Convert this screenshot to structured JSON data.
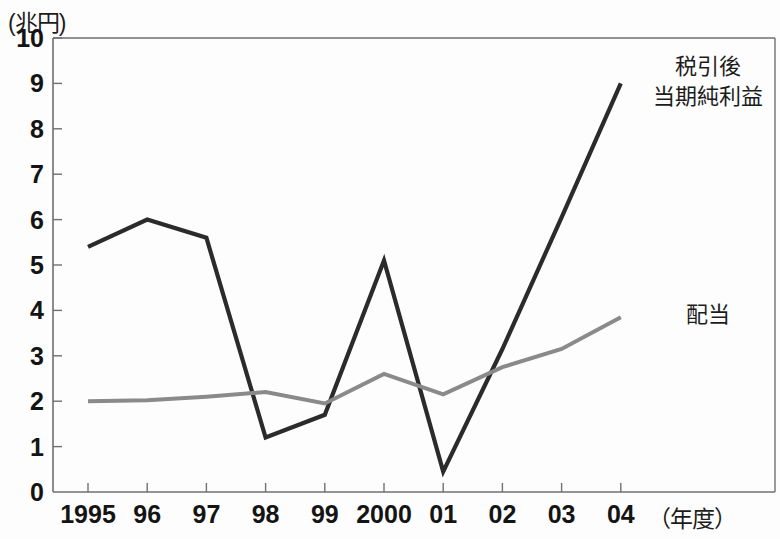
{
  "axis": {
    "y_unit_label": "(兆円)",
    "x_unit_label": "（年度）",
    "y_ticks": [
      "0",
      "1",
      "2",
      "3",
      "4",
      "5",
      "6",
      "7",
      "8",
      "9",
      "10"
    ],
    "x_ticks": [
      "1995",
      "96",
      "97",
      "98",
      "99",
      "2000",
      "01",
      "02",
      "03",
      "04"
    ]
  },
  "legend": {
    "net_income_line1": "税引後",
    "net_income_line2": "当期純利益",
    "dividend": "配当"
  },
  "colors": {
    "net_income": "#2b2b2b",
    "dividend": "#8a8a8a",
    "axis": "#6f6f6f",
    "text": "#141414"
  },
  "chart_data": {
    "type": "line",
    "title": "",
    "xlabel": "（年度）",
    "ylabel": "(兆円)",
    "ylim": [
      0,
      10
    ],
    "grid": false,
    "legend_position": "inline-right",
    "categories": [
      "1995",
      "96",
      "97",
      "98",
      "99",
      "2000",
      "01",
      "02",
      "03",
      "04"
    ],
    "series": [
      {
        "name": "税引後当期純利益",
        "color": "#2b2b2b",
        "values": [
          5.4,
          6.0,
          5.6,
          1.2,
          1.7,
          5.1,
          0.45,
          3.15,
          6.05,
          9.0
        ]
      },
      {
        "name": "配当",
        "color": "#8a8a8a",
        "values": [
          2.0,
          2.02,
          2.1,
          2.2,
          1.95,
          2.6,
          2.15,
          2.75,
          3.15,
          3.85
        ]
      }
    ]
  }
}
